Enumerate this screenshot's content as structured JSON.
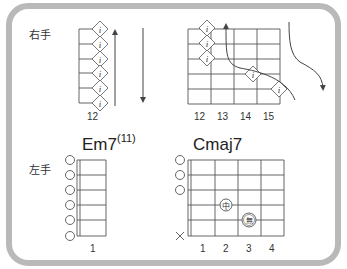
{
  "right_hand": {
    "label": "右手",
    "left_diagram": {
      "fret_label": "12",
      "strings": 6,
      "finger_mark": "i",
      "arrows": [
        "up",
        "down"
      ]
    },
    "right_diagram": {
      "fret_labels": [
        "12",
        "13",
        "14",
        "15"
      ],
      "finger_mark": "i",
      "marks": [
        {
          "string": 1,
          "fret": "12"
        },
        {
          "string": 2,
          "fret": "12"
        },
        {
          "string": 3,
          "fret": "12"
        },
        {
          "string": 4,
          "fret": "14"
        },
        {
          "string": 5,
          "fret": "15"
        }
      ],
      "arrows": [
        "curved-up",
        "curved-down"
      ]
    }
  },
  "left_hand": {
    "label": "左手",
    "chords": [
      {
        "name": "Em7",
        "extension": "(11)",
        "fret_labels": [
          "1"
        ],
        "open_strings": [
          1,
          2,
          3,
          4,
          5,
          6
        ],
        "muted_strings": []
      },
      {
        "name": "Cmaj7",
        "extension": "",
        "fret_labels": [
          "1",
          "2",
          "3",
          "4"
        ],
        "open_strings": [
          1,
          2,
          3
        ],
        "muted_strings": [
          6
        ],
        "fingers": [
          {
            "string": 4,
            "fret": 2,
            "mark": "中"
          },
          {
            "string": 5,
            "fret": 3,
            "mark": "無"
          }
        ]
      }
    ]
  },
  "colors": {
    "frame": "#b9b9b9",
    "line": "#555555",
    "text": "#333333"
  }
}
